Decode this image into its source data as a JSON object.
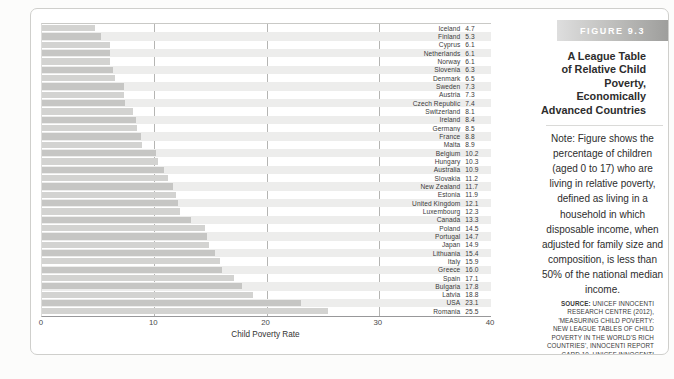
{
  "figure": {
    "label": "FIGURE 9.3",
    "title_lines": [
      "A League Table",
      "of Relative Child",
      "Poverty, Economically",
      "Advanced Countries"
    ],
    "note": "Note: Figure shows the percentage of children (aged 0 to 17) who are living in relative poverty, defined as living in a household in which disposable income, when adjusted for family size and composition, is less than 50% of the national median income.",
    "source_label": "SOURCE:",
    "source_text": " UNICEF INNOCENTI RESEARCH CENTRE (2012), 'MEASURING CHILD POVERTY: NEW LEAGUE TABLES OF CHILD POVERTY IN THE WORLD'S RICH COUNTRIES', INNOCENTI REPORT CARD 10, UNICEF INNOCENTI RESEARCH CENTRE, FLORENCE."
  },
  "chart_data": {
    "type": "bar",
    "orientation": "horizontal",
    "xlabel": "Child Poverty Rate",
    "ylabel": "",
    "xlim": [
      0,
      40
    ],
    "xticks": [
      0,
      10,
      20,
      30,
      40
    ],
    "grid": "vertical-at-10-20-30",
    "legend": "none",
    "categories": [
      "Iceland",
      "Finland",
      "Cyprus",
      "Netherlands",
      "Norway",
      "Slovenia",
      "Denmark",
      "Sweden",
      "Austria",
      "Czech Republic",
      "Switzerland",
      "Ireland",
      "Germany",
      "France",
      "Malta",
      "Belgium",
      "Hungary",
      "Australia",
      "Slovakia",
      "New Zealand",
      "Estonia",
      "United Kingdom",
      "Luxembourg",
      "Canada",
      "Poland",
      "Portugal",
      "Japan",
      "Lithuania",
      "Italy",
      "Greece",
      "Spain",
      "Bulgaria",
      "Latvia",
      "USA",
      "Romania"
    ],
    "values": [
      4.7,
      5.3,
      6.1,
      6.1,
      6.1,
      6.3,
      6.5,
      7.3,
      7.3,
      7.4,
      8.1,
      8.4,
      8.5,
      8.8,
      8.9,
      10.2,
      10.3,
      10.9,
      11.2,
      11.7,
      11.9,
      12.1,
      12.3,
      13.3,
      14.5,
      14.7,
      14.9,
      15.4,
      15.9,
      16.0,
      17.1,
      17.8,
      18.8,
      23.1,
      25.5
    ],
    "bar_color": "#d3d3d1",
    "bar_color_alt": "#c6c6c4",
    "band_color": "#ededec",
    "gridline_color": "#b5b5b3"
  }
}
